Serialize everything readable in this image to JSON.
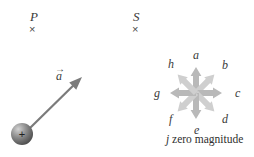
{
  "figure": {
    "width": 254,
    "height": 157,
    "background": "#ffffff"
  },
  "points": [
    {
      "label": "P",
      "mark": "×",
      "x": 30,
      "y": 10,
      "mark_x": 29,
      "mark_y": 24
    },
    {
      "label": "S",
      "mark": "×",
      "x": 133,
      "y": 10,
      "mark_x": 132,
      "mark_y": 24
    }
  ],
  "particle": {
    "name": "charged-sphere",
    "charge_sign": "+",
    "center_x": 22,
    "center_y": 134,
    "radius": 11,
    "body_color": "#6f6f6f",
    "highlight_color": "#c9c9c9",
    "shadow_color": "#3f3f3f"
  },
  "acceleration_vector": {
    "label": "a",
    "arrow_accent": "→",
    "label_x": 56,
    "label_y": 70,
    "tail_x": 30,
    "tail_y": 128,
    "tip_x": 82,
    "tip_y": 77,
    "color": "#7b7b7b",
    "stroke_width": 2.2
  },
  "compass": {
    "name": "direction-compass-rose",
    "center_x": 196,
    "center_y": 93,
    "arrow_length": 26,
    "arrow_color": "#cfcfcf",
    "arrow_color_dark": "#b9b9b9",
    "directions": [
      {
        "key": "a",
        "label": "a",
        "angle_deg": 90,
        "label_x": 193,
        "label_y": 49
      },
      {
        "key": "b",
        "label": "b",
        "angle_deg": 45,
        "label_x": 222,
        "label_y": 59
      },
      {
        "key": "c",
        "label": "c",
        "angle_deg": 0,
        "label_x": 235,
        "label_y": 87
      },
      {
        "key": "d",
        "label": "d",
        "angle_deg": 315,
        "label_x": 222,
        "label_y": 113
      },
      {
        "key": "e",
        "label": "e",
        "angle_deg": 270,
        "label_x": 194,
        "label_y": 124
      },
      {
        "key": "f",
        "label": "f",
        "angle_deg": 225,
        "label_x": 169,
        "label_y": 113
      },
      {
        "key": "g",
        "label": "g",
        "angle_deg": 180,
        "label_x": 154,
        "label_y": 87
      },
      {
        "key": "h",
        "label": "h",
        "angle_deg": 135,
        "label_x": 168,
        "label_y": 58
      }
    ],
    "caption": {
      "symbol": "j",
      "text": "zero magnitude",
      "x": 166,
      "y": 134
    }
  }
}
